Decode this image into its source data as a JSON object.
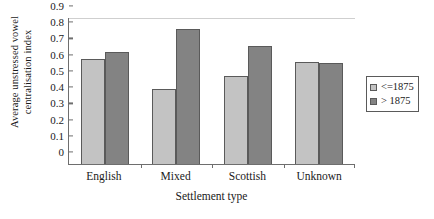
{
  "chart_data": {
    "type": "bar",
    "title": "",
    "xlabel": "Settlement type",
    "ylabel_lines": [
      "Average unstressed vowel",
      "centralisation index"
    ],
    "ylabel": "Average unstressed vowel centralisation index",
    "categories": [
      "English",
      "Mixed",
      "Scottish",
      "Unknown"
    ],
    "series": [
      {
        "name": "<=1875",
        "color": "#c3c3c3",
        "values": [
          0.65,
          0.46,
          0.54,
          0.63
        ]
      },
      {
        "name": "> 1875",
        "color": "#838383",
        "values": [
          0.69,
          0.83,
          0.73,
          0.62
        ]
      }
    ],
    "ylim": [
      0,
      0.9
    ],
    "yticks": [
      "0.9",
      "0.8",
      "0.7",
      "0.6",
      "0.5",
      "0.4",
      "0.3",
      "0.2",
      "0.1",
      "0"
    ],
    "ytick_values": [
      0.9,
      0.8,
      0.7,
      0.6,
      0.5,
      0.4,
      0.3,
      0.2,
      0.1,
      0
    ],
    "grid": false,
    "legend_position": "right"
  }
}
